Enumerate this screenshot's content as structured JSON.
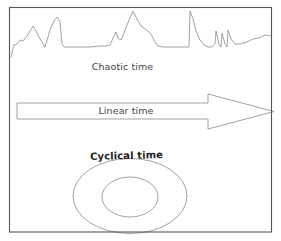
{
  "figure": {
    "background_color": "#ffffff",
    "frame": {
      "name": "outer-frame",
      "stroke": "#555555",
      "x": 9.5,
      "y": 7.5,
      "width": 262,
      "height": 224.5
    }
  },
  "labels": {
    "chaotic": "Chaotic time",
    "linear": "Linear time",
    "cyclical": "Cyclical time"
  },
  "chart_data": {
    "type": "line",
    "title": "",
    "xlabel": "",
    "ylabel": "",
    "grid": false,
    "legend": "none",
    "annotations": [
      "Chaotic time",
      "Linear time",
      "Cyclical time"
    ],
    "panels": [
      {
        "name": "chaotic-time",
        "label": "Chaotic time",
        "type": "line",
        "stroke": "#8a8a8a",
        "stroke_width": 0.8,
        "xlim": [
          11,
          271
        ],
        "ylim": [
          10,
          58
        ],
        "points": [
          [
            11,
            57
          ],
          [
            14,
            45
          ],
          [
            17,
            44
          ],
          [
            20,
            40
          ],
          [
            23,
            41
          ],
          [
            27,
            36
          ],
          [
            30,
            31
          ],
          [
            33,
            26
          ],
          [
            36,
            31
          ],
          [
            39,
            37
          ],
          [
            42,
            42
          ],
          [
            45,
            47
          ],
          [
            48,
            37
          ],
          [
            51,
            27
          ],
          [
            54,
            21
          ],
          [
            57,
            17
          ],
          [
            60,
            22
          ],
          [
            62,
            44
          ],
          [
            64,
            47
          ],
          [
            70,
            47
          ],
          [
            80,
            47
          ],
          [
            90,
            47
          ],
          [
            100,
            46
          ],
          [
            105,
            46
          ],
          [
            110,
            45
          ],
          [
            113,
            38
          ],
          [
            116,
            32
          ],
          [
            118,
            38
          ],
          [
            121,
            40
          ],
          [
            124,
            33
          ],
          [
            127,
            25
          ],
          [
            130,
            18
          ],
          [
            133,
            11
          ],
          [
            137,
            19
          ],
          [
            141,
            26
          ],
          [
            145,
            29
          ],
          [
            148,
            31
          ],
          [
            152,
            36
          ],
          [
            155,
            42
          ],
          [
            158,
            46
          ],
          [
            163,
            47
          ],
          [
            170,
            47
          ],
          [
            178,
            47
          ],
          [
            186,
            47
          ],
          [
            189,
            47
          ],
          [
            190,
            11
          ],
          [
            193,
            19
          ],
          [
            196,
            31
          ],
          [
            200,
            40
          ],
          [
            204,
            45
          ],
          [
            208,
            47
          ],
          [
            212,
            47
          ],
          [
            215,
            44
          ],
          [
            216,
            31
          ],
          [
            219,
            44
          ],
          [
            221,
            47
          ],
          [
            222,
            33
          ],
          [
            225,
            44
          ],
          [
            227,
            47
          ],
          [
            228,
            30
          ],
          [
            231,
            39
          ],
          [
            235,
            44
          ],
          [
            240,
            44
          ],
          [
            247,
            42
          ],
          [
            253,
            39
          ],
          [
            259,
            38
          ],
          [
            265,
            35
          ],
          [
            271,
            36
          ]
        ]
      },
      {
        "name": "linear-time",
        "label": "Linear time",
        "type": "arrow",
        "stroke": "#8a8a8a",
        "stroke_width": 0.8,
        "fill": "none",
        "body": {
          "x": 17,
          "y": 103,
          "width": 191,
          "height": 16
        },
        "head": {
          "base_x": 208,
          "tip_x": 274,
          "top_y": 94,
          "bottom_y": 129,
          "tip_y": 111.5
        },
        "direction": "right"
      },
      {
        "name": "cyclical-time",
        "label": "Cyclical time",
        "type": "ellipse-pair",
        "stroke": "#8a8a8a",
        "stroke_width": 0.8,
        "fill": "none",
        "outer": {
          "cx": 130,
          "cy": 196,
          "rx": 57,
          "ry": 37.5
        },
        "inner": {
          "cx": 130,
          "cy": 197,
          "rx": 28,
          "ry": 20
        }
      }
    ]
  }
}
